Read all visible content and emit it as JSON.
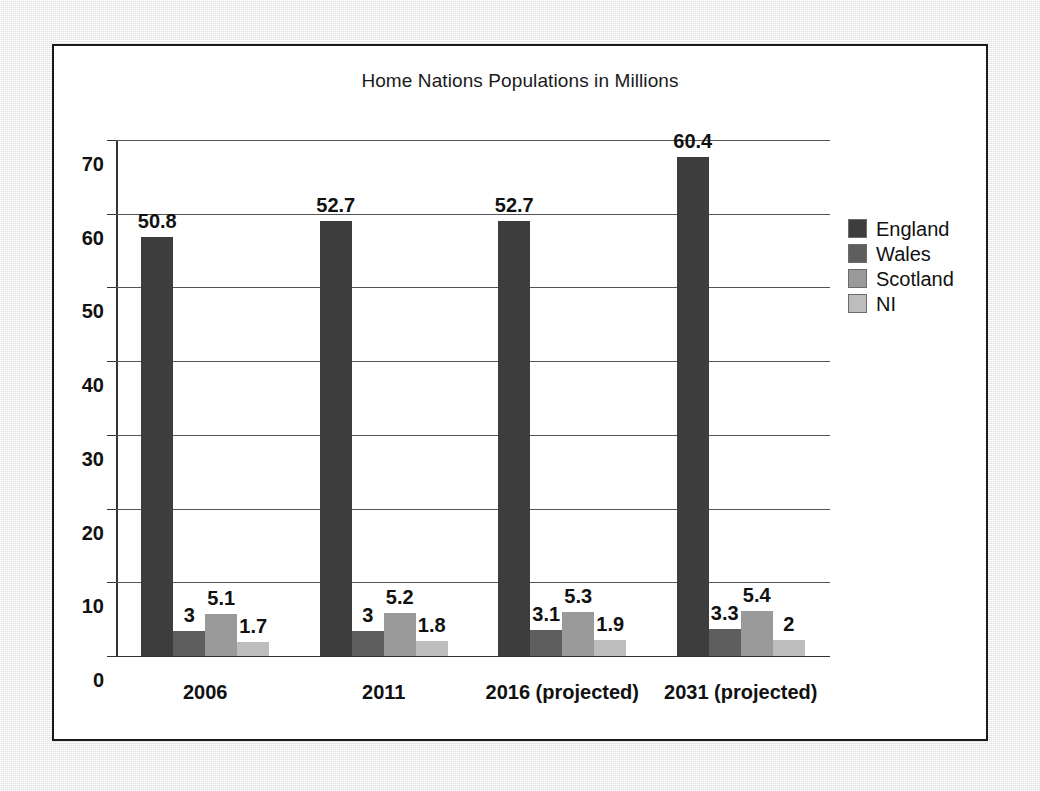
{
  "figure": {
    "background_color": "#eeeeee",
    "panel_background": "#ffffff",
    "panel_border_color": "#1a1a1a"
  },
  "chart_data": {
    "type": "bar",
    "title": "Home Nations Populations in Millions",
    "xlabel": "",
    "ylabel": "",
    "ylim": [
      0,
      70
    ],
    "yticks": [
      0,
      10,
      20,
      30,
      40,
      50,
      60,
      70
    ],
    "ytick_labels": [
      "0",
      "10",
      "20",
      "30",
      "40",
      "50",
      "60",
      "70"
    ],
    "grid": true,
    "legend_position": "right",
    "categories": [
      "2006",
      "2011",
      "2016 (projected)",
      "2031 (projected)"
    ],
    "series": [
      {
        "name": "England",
        "color": "#3d3d3d",
        "values": [
          50.8,
          52.7,
          52.7,
          60.4
        ],
        "labels": [
          "50.8",
          "52.7",
          "52.7",
          "60.4"
        ]
      },
      {
        "name": "Wales",
        "color": "#5e5e5e",
        "values": [
          3,
          3,
          3.1,
          3.3
        ],
        "labels": [
          "3",
          "3",
          "3.1",
          "3.3"
        ]
      },
      {
        "name": "Scotland",
        "color": "#9a9a9a",
        "values": [
          5.1,
          5.2,
          5.3,
          5.4
        ],
        "labels": [
          "5.1",
          "5.2",
          "5.3",
          "5.4"
        ]
      },
      {
        "name": "NI",
        "color": "#bdbdbd",
        "values": [
          1.7,
          1.8,
          1.9,
          2
        ],
        "labels": [
          "1.7",
          "1.8",
          "1.9",
          "2"
        ]
      }
    ]
  }
}
